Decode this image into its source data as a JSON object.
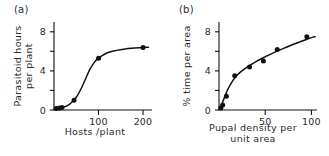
{
  "figure": {
    "background": "#ffffff",
    "ink_color": "#111111"
  },
  "panels": {
    "a": {
      "label": "(a)",
      "xlabel": "Hosts /plant",
      "ylabel_line1": "Parasitoid hours",
      "ylabel_line2": "per plant",
      "xticks": [
        "100",
        "200"
      ],
      "yticks": [
        "0",
        "4",
        "8"
      ]
    },
    "b": {
      "label": "(b)",
      "xlabel": "Pupal density per\nunit area",
      "ylabel": "% time per area",
      "xticks": [
        "50",
        "100"
      ],
      "yticks": [
        "0",
        "4",
        "8"
      ]
    }
  },
  "chart_data": [
    {
      "type": "scatter",
      "panel": "a",
      "title": "(a)",
      "xlabel": "Hosts /plant",
      "ylabel": "Parasitoid hours per plant",
      "xlim": [
        0,
        220
      ],
      "ylim": [
        0,
        9
      ],
      "xticks": [
        100,
        200
      ],
      "xticklabels": [
        "100",
        "200"
      ],
      "yticks": [
        0,
        2,
        4,
        6,
        8
      ],
      "yticklabels": [
        "0",
        "",
        "4",
        "",
        "8"
      ],
      "grid": false,
      "legend": "none",
      "x": [
        5,
        12,
        18,
        45,
        100,
        200
      ],
      "y": [
        0.15,
        0.2,
        0.25,
        1.0,
        5.3,
        6.4
      ],
      "fit_curve": {
        "shape": "sigmoid",
        "x": [
          2,
          10,
          20,
          30,
          40,
          50,
          60,
          70,
          80,
          90,
          100,
          120,
          140,
          160,
          180,
          200,
          212
        ],
        "y": [
          0.12,
          0.18,
          0.28,
          0.45,
          0.8,
          1.3,
          2.1,
          3.1,
          4.1,
          4.85,
          5.3,
          5.85,
          6.1,
          6.25,
          6.33,
          6.4,
          6.42
        ]
      }
    },
    {
      "type": "scatter",
      "panel": "b",
      "title": "(b)",
      "xlabel": "Pupal density per unit area",
      "ylabel": "% time per area",
      "xlim": [
        0,
        106
      ],
      "ylim": [
        0,
        9
      ],
      "xticks": [
        50,
        100
      ],
      "xticklabels": [
        "50",
        "100"
      ],
      "yticks": [
        0,
        2,
        4,
        6,
        8
      ],
      "yticklabels": [
        "0",
        "",
        "4",
        "",
        "8"
      ],
      "grid": false,
      "legend": "none",
      "x": [
        2,
        4,
        8,
        17,
        33,
        48,
        63,
        95
      ],
      "y": [
        0.2,
        0.5,
        1.4,
        3.5,
        4.4,
        5.0,
        6.2,
        7.5
      ],
      "fit_curve": {
        "shape": "saturating",
        "x": [
          1,
          3,
          6,
          10,
          15,
          20,
          30,
          40,
          50,
          60,
          70,
          80,
          90,
          100,
          104
        ],
        "y": [
          0.15,
          0.6,
          1.3,
          2.2,
          3.0,
          3.6,
          4.35,
          4.95,
          5.45,
          5.9,
          6.3,
          6.7,
          7.05,
          7.4,
          7.5
        ]
      }
    }
  ]
}
